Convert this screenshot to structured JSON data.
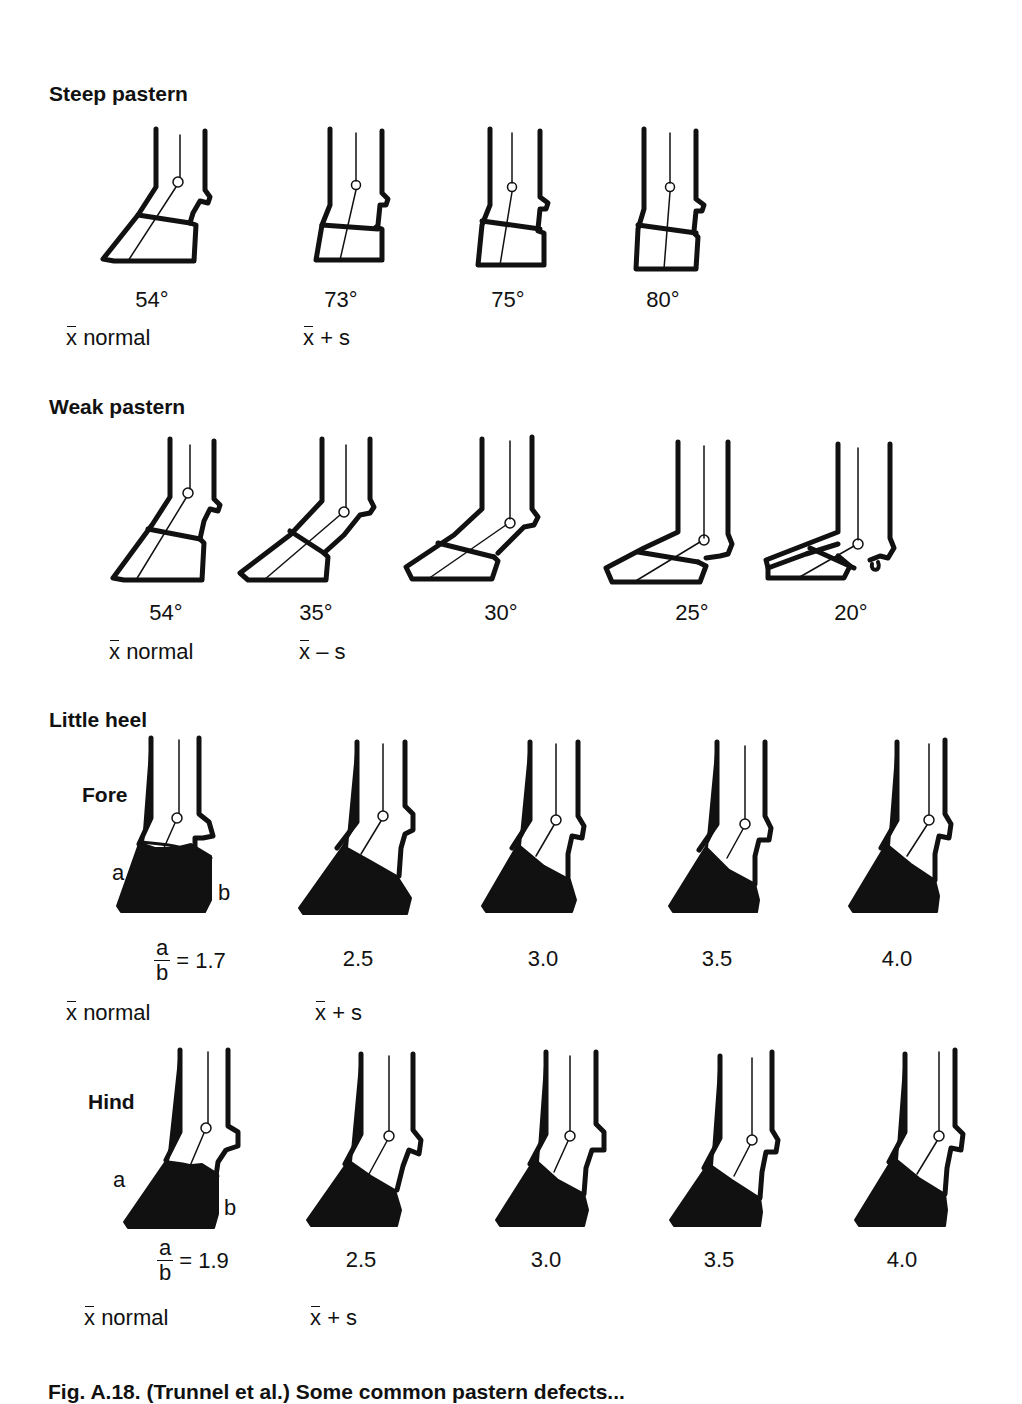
{
  "sections": {
    "steep": {
      "title": "Steep pastern",
      "angles": [
        "54°",
        "73°",
        "75°",
        "80°"
      ],
      "stats": [
        "normal",
        "+ s"
      ]
    },
    "weak": {
      "title": "Weak pastern",
      "angles": [
        "54°",
        "35°",
        "30°",
        "25°",
        "20°"
      ],
      "stats": [
        "normal",
        "– s"
      ]
    },
    "heel": {
      "title": "Little heel",
      "fore": {
        "label": "Fore",
        "ratio_num": "a",
        "ratio_den": "b",
        "first_value": "= 1.7",
        "values": [
          "2.5",
          "3.0",
          "3.5",
          "4.0"
        ],
        "stats": [
          "normal",
          "+ s"
        ],
        "letter_a": "a",
        "letter_b": "b"
      },
      "hind": {
        "label": "Hind",
        "ratio_num": "a",
        "ratio_den": "b",
        "first_value": "= 1.9",
        "values": [
          "2.5",
          "3.0",
          "3.5",
          "4.0"
        ],
        "stats": [
          "normal",
          "+ s"
        ],
        "letter_a": "a",
        "letter_b": "b"
      }
    }
  },
  "symbols": {
    "xbar": "x"
  },
  "caption": "Fig. A.18. (Trunnel et al.) Some common pastern defects..."
}
